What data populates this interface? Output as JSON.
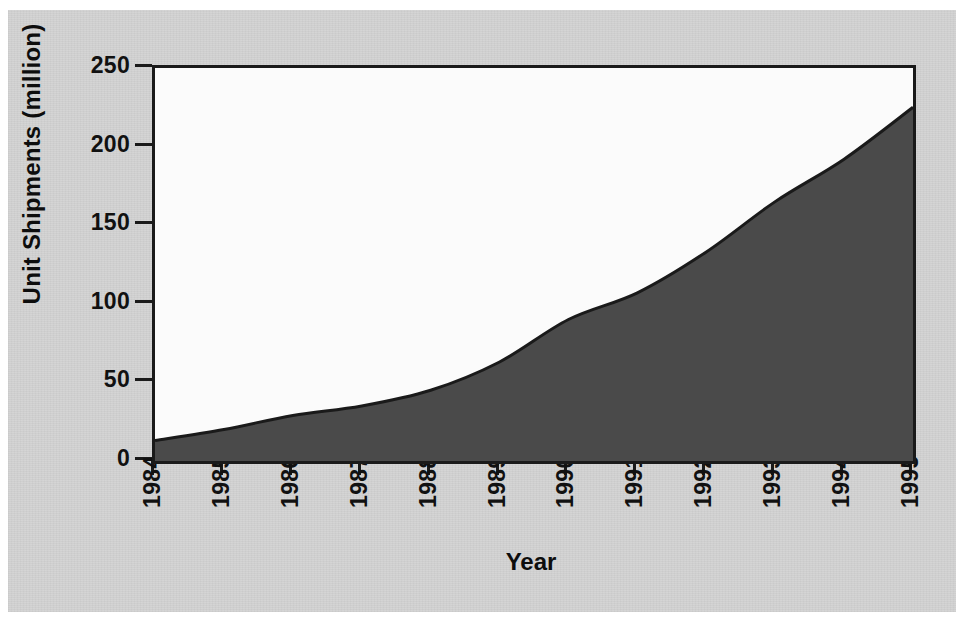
{
  "figure": {
    "background_color": "#d3d3d3",
    "plot_background_color": "#fbfbfb",
    "axis_color": "#1a1a1a"
  },
  "chart_data": {
    "type": "area",
    "title": "",
    "subtitle": "",
    "xlabel": "Year",
    "ylabel": "Unit Shipments (million)",
    "categories": [
      "1984",
      "1985",
      "1986",
      "1987",
      "1988",
      "1989",
      "1990",
      "1991",
      "1992",
      "1993",
      "1994",
      "1995"
    ],
    "x": [
      1984,
      1985,
      1986,
      1987,
      1988,
      1989,
      1990,
      1991,
      1992,
      1993,
      1994,
      1995
    ],
    "values": [
      13,
      20,
      29,
      35,
      45,
      63,
      90,
      107,
      133,
      165,
      192,
      225
    ],
    "series": [
      {
        "name": "Unit Shipments",
        "values": [
          13,
          20,
          29,
          35,
          45,
          63,
          90,
          107,
          133,
          165,
          192,
          225
        ],
        "fill_color": "#4a4a4a",
        "line_color": "#1a1a1a"
      }
    ],
    "xlim": [
      1984,
      1995
    ],
    "ylim": [
      0,
      250
    ],
    "ytick_labels": [
      "0",
      "50",
      "100",
      "150",
      "200",
      "250"
    ],
    "ytick_values": [
      0,
      50,
      100,
      150,
      200,
      250
    ],
    "xtick_labels": [
      "1984",
      "1985",
      "1986",
      "1987",
      "1988",
      "1989",
      "1990",
      "1991",
      "1992",
      "1993",
      "1994",
      "1995"
    ],
    "grid": false,
    "legend": false,
    "legend_position": "none",
    "annotations": []
  }
}
